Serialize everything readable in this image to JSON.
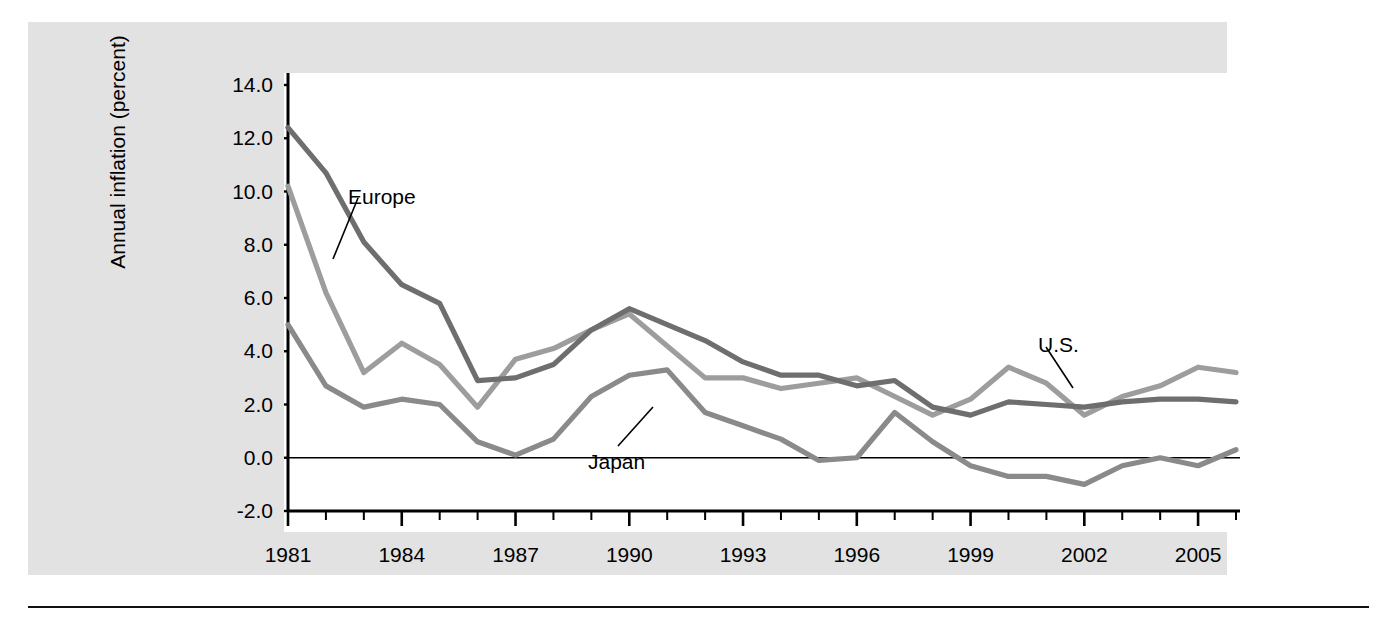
{
  "figure": {
    "panel_bg": "#e2e2e2",
    "plot_bg": "#ffffff",
    "rule_color": "#111111"
  },
  "axes": {
    "y_title": "Annual inflation (percent)",
    "y_ticks": [
      "14.0",
      "12.0",
      "10.0",
      "8.0",
      "6.0",
      "4.0",
      "2.0",
      "0.0",
      "-2.0"
    ],
    "y_tick_values": [
      14,
      12,
      10,
      8,
      6,
      4,
      2,
      0,
      -2
    ],
    "x_ticks_labeled": [
      "1981",
      "1984",
      "1987",
      "1990",
      "1993",
      "1996",
      "1999",
      "2002",
      "2005"
    ],
    "x_tick_values_labeled": [
      1981,
      1984,
      1987,
      1990,
      1993,
      1996,
      1999,
      2002,
      2005
    ],
    "x_ticks_all": [
      1981,
      1982,
      1983,
      1984,
      1985,
      1986,
      1987,
      1988,
      1989,
      1990,
      1991,
      1992,
      1993,
      1994,
      1995,
      1996,
      1997,
      1998,
      1999,
      2000,
      2001,
      2002,
      2003,
      2004,
      2005,
      2006
    ]
  },
  "annotations": [
    {
      "name": "europe",
      "text": "Europe",
      "label_x": 320,
      "label_y": 163,
      "leader_from_x": 330,
      "leader_from_y": 176,
      "leader_to_x": 305,
      "leader_to_y": 237
    },
    {
      "name": "japan",
      "text": "Japan",
      "label_x": 560,
      "label_y": 428,
      "leader_from_x": 590,
      "leader_from_y": 424,
      "leader_to_x": 625,
      "leader_to_y": 385
    },
    {
      "name": "us",
      "text": "U.S.",
      "label_x": 1010,
      "label_y": 311,
      "leader_from_x": 1018,
      "leader_from_y": 325,
      "leader_to_x": 1045,
      "leader_to_y": 366
    }
  ],
  "chart_data": {
    "type": "line",
    "title": "",
    "xlabel": "",
    "ylabel": "Annual inflation (percent)",
    "xlim": [
      1981,
      2006
    ],
    "ylim": [
      -2.0,
      14.0
    ],
    "grid": false,
    "legend": "inline labels with leader lines",
    "zero_line": true,
    "x": [
      1981,
      1982,
      1983,
      1984,
      1985,
      1986,
      1987,
      1988,
      1989,
      1990,
      1991,
      1992,
      1993,
      1994,
      1995,
      1996,
      1997,
      1998,
      1999,
      2000,
      2001,
      2002,
      2003,
      2004,
      2005,
      2006
    ],
    "series": [
      {
        "name": "Europe",
        "color": "#6e6e6e",
        "values": [
          12.4,
          10.7,
          8.1,
          6.5,
          5.8,
          2.9,
          3.0,
          3.5,
          4.8,
          5.6,
          5.0,
          4.4,
          3.6,
          3.1,
          3.1,
          2.7,
          2.9,
          1.9,
          1.6,
          2.1,
          2.0,
          1.9,
          2.1,
          2.2,
          2.2,
          2.1
        ]
      },
      {
        "name": "U.S.",
        "color": "#9d9d9d",
        "values": [
          10.2,
          6.2,
          3.2,
          4.3,
          3.5,
          1.9,
          3.7,
          4.1,
          4.8,
          5.4,
          4.2,
          3.0,
          3.0,
          2.6,
          2.8,
          3.0,
          2.3,
          1.6,
          2.2,
          3.4,
          2.8,
          1.6,
          2.3,
          2.7,
          3.4,
          3.2
        ]
      },
      {
        "name": "Japan",
        "color": "#8a8a8a",
        "values": [
          5.0,
          2.7,
          1.9,
          2.2,
          2.0,
          0.6,
          0.1,
          0.7,
          2.3,
          3.1,
          3.3,
          1.7,
          1.2,
          0.7,
          -0.1,
          0.0,
          1.7,
          0.6,
          -0.3,
          -0.7,
          -0.7,
          -1.0,
          -0.3,
          0.0,
          -0.3,
          0.3
        ]
      }
    ]
  }
}
